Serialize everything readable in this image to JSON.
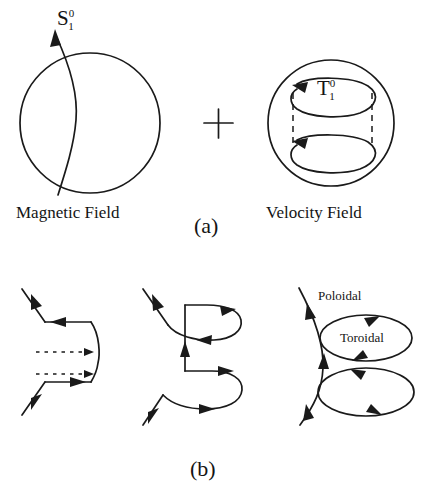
{
  "figure": {
    "panel_a": {
      "caption": "(a)",
      "magnetic": {
        "label": "Magnetic Field",
        "symbol_base": "S",
        "symbol_sup": "0",
        "symbol_sub": "1"
      },
      "operator": "+",
      "velocity": {
        "label": "Velocity Field",
        "symbol_base": "T",
        "symbol_sup": "0",
        "symbol_sub": "1"
      }
    },
    "panel_b": {
      "caption": "(b)",
      "stage3": {
        "poloidal_label": "Poloidal",
        "toroidal_label": "Toroidal"
      }
    },
    "colors": {
      "ink": "#1a1a1a",
      "background": "#ffffff"
    }
  }
}
